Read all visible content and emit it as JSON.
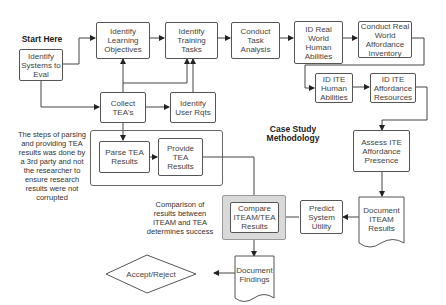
{
  "title": "Case Study Methodology",
  "start_label": "Start Here",
  "nodes": {
    "identify_systems": "Identify Systems to Eval",
    "identify_learning_objectives": "Identify Learning Objectives",
    "identify_training_tasks": "Identify Training Tasks",
    "conduct_task_analysis": "Conduct Task Analysis",
    "id_real_world_human_abilities": "ID Real World Human Abilities",
    "conduct_real_world_affordance_inventory": "Conduct Real World Affordance Inventory",
    "id_ite_human_abilities": "ID ITE Human Abilities",
    "id_ite_affordance_resources": "ID ITE Affordance Resources",
    "collect_teas": "Collect TEA's",
    "identify_user_rqts": "Identify User Rqts",
    "parse_tea_results": "Parse TEA Results",
    "provide_tea_results": "Provide TEA Results",
    "assess_ite_affordance_presence": "Assess ITE Affordance Presence",
    "document_iteam_results": "Document ITEAM Results",
    "predict_system_utility": "Predict System Utility",
    "compare_iteam_tea_results": "Compare ITEAM/TEA Results",
    "document_findings": "Document Findings",
    "accept_reject": "Accept/Reject"
  },
  "annotations": {
    "third_party_note": "The steps of parsing and providing TEA results was done by a 3rd party and not the researcher to ensure research results were not corrupted",
    "comparison_note": "Comparison of results between ITEAM and TEA determines success"
  }
}
